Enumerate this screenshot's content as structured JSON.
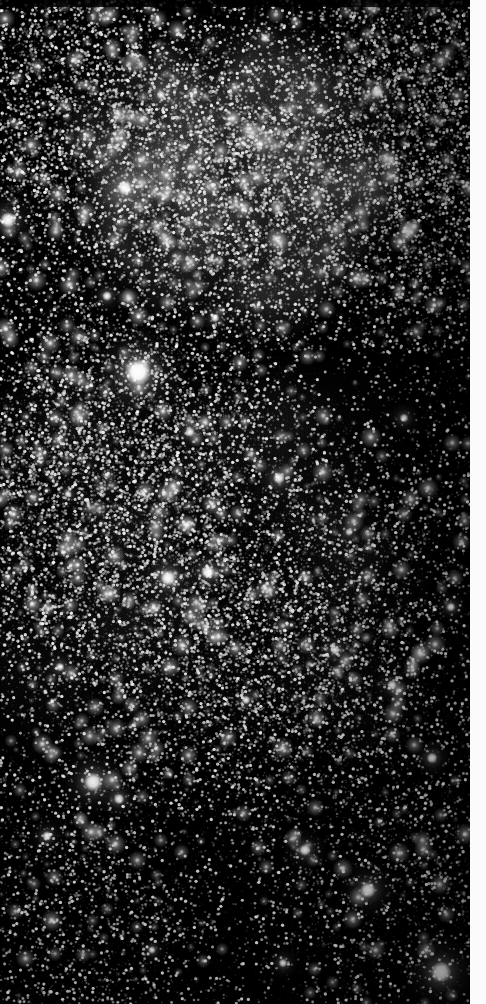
{
  "image": {
    "kind": "astronomical-star-field",
    "title": "",
    "width": 486,
    "height": 1004,
    "plate_width": 470,
    "plate_height": 1004,
    "colors": {
      "background": "#000000",
      "star": "#ffffff",
      "page": "#ffffff",
      "border_strip": "#fbfbfb",
      "nebula_glow": "#8f8f8f"
    },
    "border": {
      "right_strip_x": 470,
      "right_strip_width": 16,
      "top_band_height": 7
    },
    "visible_text": [],
    "labels": [],
    "annotations": []
  },
  "chart_data": {
    "type": "scatter",
    "title": "",
    "subtitle": "",
    "xlabel": "",
    "ylabel": "",
    "xlim": [
      0,
      470
    ],
    "ylim": [
      0,
      1004
    ],
    "grid": false,
    "legend": [],
    "background": "#000000",
    "point_color": "#ffffff",
    "density_field": {
      "note": "Relative stellar surface density by region, 0-1 scale",
      "regions": [
        {
          "name": "upper-middle-starcloud",
          "cx": 230,
          "cy": 175,
          "rx": 150,
          "ry": 130,
          "density": 1.0
        },
        {
          "name": "upper-left",
          "cx": 70,
          "cy": 120,
          "rx": 120,
          "ry": 160,
          "density": 0.72
        },
        {
          "name": "upper-right",
          "cx": 400,
          "cy": 140,
          "rx": 130,
          "ry": 170,
          "density": 0.78
        },
        {
          "name": "mid-left-band",
          "cx": 110,
          "cy": 500,
          "rx": 170,
          "ry": 200,
          "density": 0.82
        },
        {
          "name": "mid-center",
          "cx": 240,
          "cy": 620,
          "rx": 190,
          "ry": 180,
          "density": 0.7
        },
        {
          "name": "lower-left",
          "cx": 80,
          "cy": 880,
          "rx": 150,
          "ry": 170,
          "density": 0.34
        },
        {
          "name": "lower-right",
          "cx": 380,
          "cy": 850,
          "rx": 150,
          "ry": 180,
          "density": 0.3
        },
        {
          "name": "right-edge-dark",
          "cx": 450,
          "cy": 560,
          "rx": 90,
          "ry": 250,
          "density": 0.26
        }
      ]
    },
    "bright_stars": [
      {
        "id": "star-01",
        "x": 138,
        "y": 372,
        "radius": 13.5,
        "mag": 1.0,
        "label": "brightest-star"
      },
      {
        "id": "star-02",
        "x": 93,
        "y": 782,
        "radius": 9.5,
        "mag": 0.92,
        "label": ""
      },
      {
        "id": "star-03",
        "x": 441,
        "y": 972,
        "radius": 10.5,
        "mag": 0.94,
        "label": ""
      },
      {
        "id": "star-04",
        "x": 368,
        "y": 890,
        "radius": 8.0,
        "mag": 0.88,
        "label": ""
      },
      {
        "id": "star-05",
        "x": 168,
        "y": 578,
        "radius": 8.0,
        "mag": 0.88,
        "label": ""
      },
      {
        "id": "star-06",
        "x": 208,
        "y": 572,
        "radius": 7.0,
        "mag": 0.85,
        "label": ""
      },
      {
        "id": "star-07",
        "x": 125,
        "y": 188,
        "radius": 7.5,
        "mag": 0.86,
        "label": ""
      },
      {
        "id": "star-08",
        "x": 8,
        "y": 220,
        "radius": 8.0,
        "mag": 0.87,
        "label": ""
      },
      {
        "id": "star-09",
        "x": 279,
        "y": 478,
        "radius": 6.0,
        "mag": 0.8,
        "label": ""
      },
      {
        "id": "star-10",
        "x": 377,
        "y": 92,
        "radius": 6.5,
        "mag": 0.82,
        "label": ""
      },
      {
        "id": "star-11",
        "x": 305,
        "y": 850,
        "radius": 6.0,
        "mag": 0.8,
        "label": ""
      },
      {
        "id": "star-12",
        "x": 432,
        "y": 758,
        "radius": 5.5,
        "mag": 0.78,
        "label": ""
      },
      {
        "id": "star-13",
        "x": 119,
        "y": 799,
        "radius": 5.5,
        "mag": 0.78,
        "label": ""
      },
      {
        "id": "star-14",
        "x": 47,
        "y": 836,
        "radius": 5.0,
        "mag": 0.76,
        "label": ""
      },
      {
        "id": "star-15",
        "x": 392,
        "y": 685,
        "radius": 5.0,
        "mag": 0.76,
        "label": ""
      },
      {
        "id": "star-16",
        "x": 190,
        "y": 432,
        "radius": 5.0,
        "mag": 0.75,
        "label": ""
      },
      {
        "id": "star-17",
        "x": 107,
        "y": 296,
        "radius": 5.0,
        "mag": 0.75,
        "label": ""
      },
      {
        "id": "star-18",
        "x": 335,
        "y": 650,
        "radius": 5.0,
        "mag": 0.74,
        "label": ""
      },
      {
        "id": "star-19",
        "x": 246,
        "y": 700,
        "radius": 4.5,
        "mag": 0.72,
        "label": ""
      },
      {
        "id": "star-20",
        "x": 451,
        "y": 607,
        "radius": 4.5,
        "mag": 0.72,
        "label": ""
      },
      {
        "id": "star-21",
        "x": 283,
        "y": 963,
        "radius": 4.5,
        "mag": 0.72,
        "label": ""
      },
      {
        "id": "star-22",
        "x": 404,
        "y": 418,
        "radius": 4.5,
        "mag": 0.71,
        "label": ""
      },
      {
        "id": "star-23",
        "x": 215,
        "y": 318,
        "radius": 4.5,
        "mag": 0.71,
        "label": ""
      },
      {
        "id": "star-24",
        "x": 60,
        "y": 667,
        "radius": 4.5,
        "mag": 0.7,
        "label": ""
      },
      {
        "id": "star-25",
        "x": 152,
        "y": 950,
        "radius": 4.0,
        "mag": 0.68,
        "label": ""
      },
      {
        "id": "star-26",
        "x": 349,
        "y": 532,
        "radius": 4.0,
        "mag": 0.68,
        "label": ""
      },
      {
        "id": "star-27",
        "x": 265,
        "y": 38,
        "radius": 4.5,
        "mag": 0.7,
        "label": ""
      },
      {
        "id": "star-28",
        "x": 161,
        "y": 95,
        "radius": 4.5,
        "mag": 0.7,
        "label": ""
      },
      {
        "id": "star-29",
        "x": 68,
        "y": 494,
        "radius": 4.0,
        "mag": 0.67,
        "label": ""
      },
      {
        "id": "star-30",
        "x": 318,
        "y": 203,
        "radius": 4.0,
        "mag": 0.66,
        "label": ""
      }
    ]
  }
}
